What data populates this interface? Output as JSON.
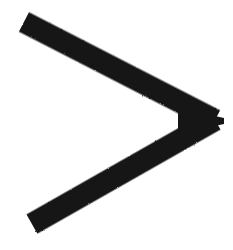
{
  "canvas": {
    "width": 233,
    "height": 250,
    "background_color": "#ffffff",
    "paper_tint_color": "#fbfbf9",
    "alt_text": "Hand-drawn greater-than chevron symbol in thick black ink"
  },
  "ink": {
    "color": "#141414",
    "edge_color": "#2a2a2a",
    "stroke_width_px": 21,
    "stroke_count": 1,
    "cap_style": "butt",
    "join_style": "miter",
    "texture": "grainy",
    "symbol": "greater-than",
    "glyph": ">"
  },
  "geometry": {
    "top_endpoint": {
      "x": 24,
      "y": 22
    },
    "vertex_tip": {
      "x": 215,
      "y": 120
    },
    "vertex_inner_corner": {
      "x": 180,
      "y": 120
    },
    "bottom_endpoint": {
      "x": 32,
      "y": 224
    },
    "upper_arm_path": "M 24 22 L 215 120",
    "lower_arm_path": "M 215 120 L 32 224",
    "outline_path": "M 24 22 L 215 120 L 32 224 L 43 234 L 234 130 L 234 110 L 34 12 Z"
  },
  "grain_specks": [
    {
      "x": 46,
      "y": 41,
      "r": 1.5,
      "o": 0.55
    },
    {
      "x": 68,
      "y": 52,
      "r": 1.2,
      "o": 0.45
    },
    {
      "x": 92,
      "y": 66,
      "r": 1.6,
      "o": 0.5
    },
    {
      "x": 115,
      "y": 78,
      "r": 1.1,
      "o": 0.42
    },
    {
      "x": 138,
      "y": 90,
      "r": 1.5,
      "o": 0.5
    },
    {
      "x": 162,
      "y": 103,
      "r": 1.2,
      "o": 0.44
    },
    {
      "x": 188,
      "y": 115,
      "r": 1.4,
      "o": 0.48
    },
    {
      "x": 196,
      "y": 129,
      "r": 1.3,
      "o": 0.46
    },
    {
      "x": 170,
      "y": 143,
      "r": 1.5,
      "o": 0.5
    },
    {
      "x": 145,
      "y": 157,
      "r": 1.2,
      "o": 0.44
    },
    {
      "x": 120,
      "y": 171,
      "r": 1.6,
      "o": 0.52
    },
    {
      "x": 96,
      "y": 185,
      "r": 1.2,
      "o": 0.45
    },
    {
      "x": 72,
      "y": 199,
      "r": 1.5,
      "o": 0.5
    },
    {
      "x": 50,
      "y": 212,
      "r": 1.3,
      "o": 0.46
    },
    {
      "x": 36,
      "y": 31,
      "r": 1.2,
      "o": 0.4
    },
    {
      "x": 57,
      "y": 47,
      "r": 1.0,
      "o": 0.38
    },
    {
      "x": 104,
      "y": 72,
      "r": 1.0,
      "o": 0.36
    },
    {
      "x": 150,
      "y": 97,
      "r": 1.1,
      "o": 0.4
    },
    {
      "x": 205,
      "y": 122,
      "r": 1.2,
      "o": 0.42
    },
    {
      "x": 132,
      "y": 164,
      "r": 1.0,
      "o": 0.38
    },
    {
      "x": 84,
      "y": 192,
      "r": 1.1,
      "o": 0.4
    },
    {
      "x": 41,
      "y": 219,
      "r": 1.2,
      "o": 0.44
    }
  ]
}
